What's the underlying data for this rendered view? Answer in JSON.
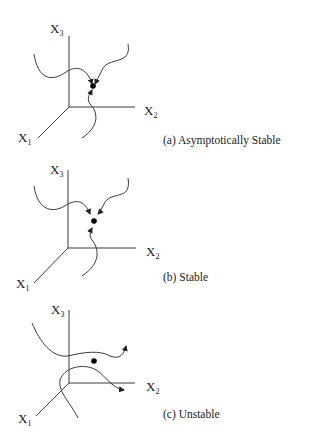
{
  "figure": {
    "panels": [
      {
        "id": "a",
        "caption": "(a) Asymptotically Stable",
        "axes": {
          "x1": "X",
          "x1_sub": "1",
          "x2": "X",
          "x2_sub": "2",
          "x3": "X",
          "x3_sub": "3"
        },
        "trajectories": 3,
        "behavior": "converges to equilibrium"
      },
      {
        "id": "b",
        "caption": "(b) Stable",
        "axes": {
          "x1": "X",
          "x1_sub": "1",
          "x2": "X",
          "x2_sub": "2",
          "x3": "X",
          "x3_sub": "3"
        },
        "trajectories": 3,
        "behavior": "stays near equilibrium"
      },
      {
        "id": "c",
        "caption": "(c) Unstable",
        "axes": {
          "x1": "X",
          "x1_sub": "1",
          "x2": "X",
          "x2_sub": "2",
          "x3": "X",
          "x3_sub": "3"
        },
        "trajectories": 2,
        "behavior": "diverges from equilibrium"
      }
    ],
    "colors": {
      "line": "#3a3a3a",
      "dot": "#000000",
      "background": "#ffffff"
    }
  }
}
